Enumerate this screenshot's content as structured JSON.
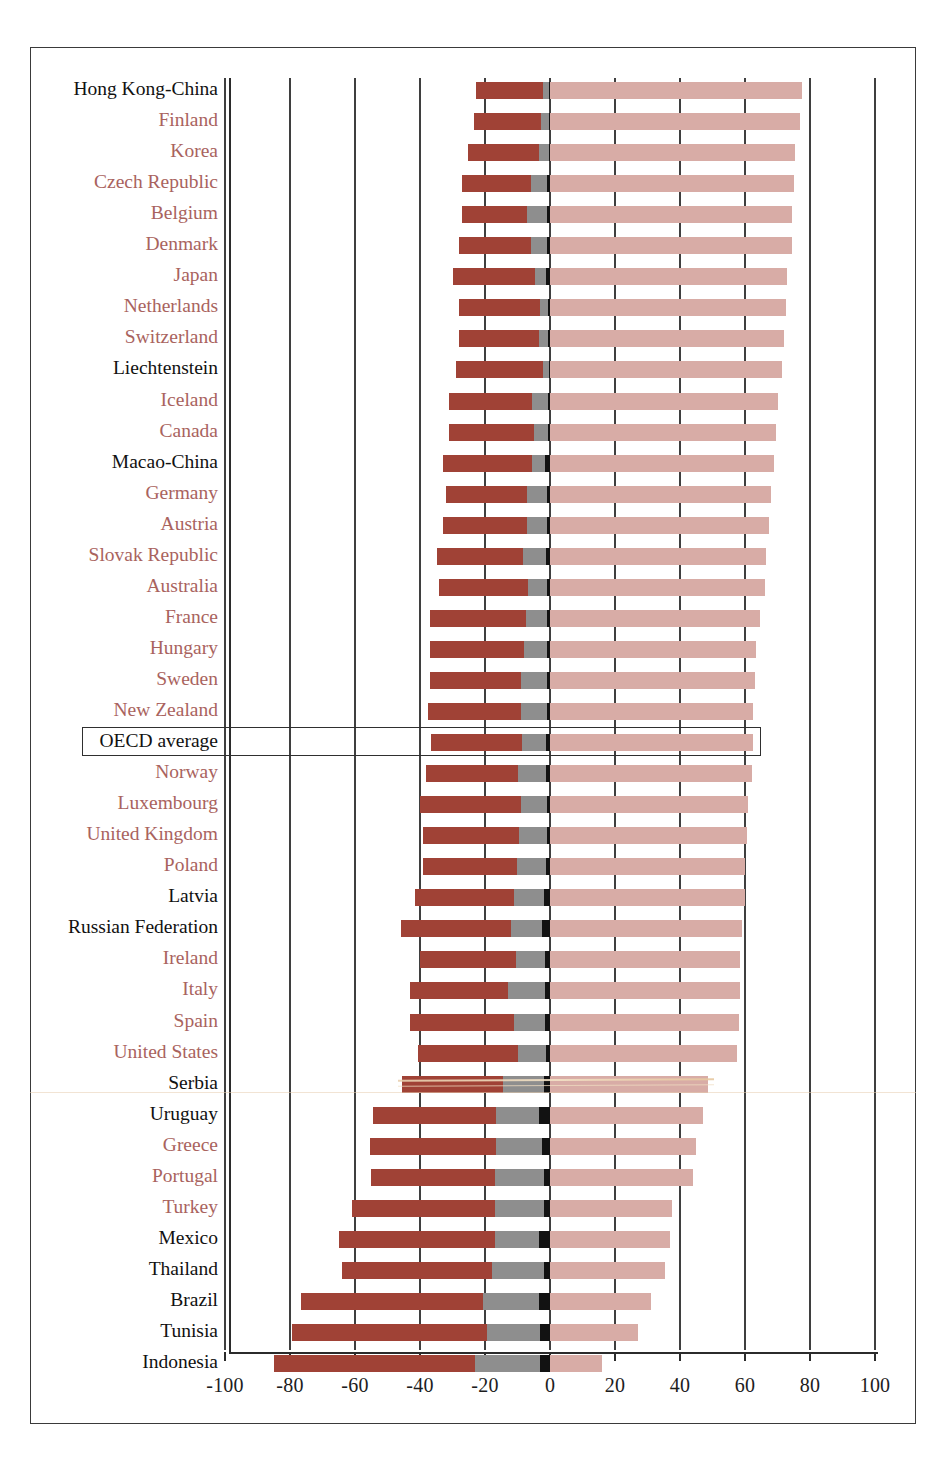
{
  "chart_data": {
    "type": "bar",
    "title": "",
    "subtitle": "",
    "xlabel": "",
    "ylabel": "",
    "orientation": "horizontal",
    "stacked": true,
    "diverging": true,
    "xlim": [
      -100,
      100
    ],
    "xticks": [
      -100,
      -80,
      -60,
      -40,
      -20,
      0,
      20,
      40,
      60,
      80,
      100
    ],
    "xticklabels": [
      "-100",
      "-80",
      "-60",
      "-40",
      "-20",
      "0",
      "20",
      "40",
      "60",
      "80",
      "100"
    ],
    "grid": true,
    "grid_axis": "x",
    "legend_position": "none",
    "series": [
      {
        "name": "below-level-1-negative",
        "color": "#a04236"
      },
      {
        "name": "level-1-negative",
        "color": "#8e8e8e"
      },
      {
        "name": "level-1-black-band",
        "color": "#121212"
      },
      {
        "name": "level-2-and-above-positive",
        "color": "#d8aca6"
      }
    ],
    "categories": [
      "Hong Kong-China",
      "Finland",
      "Korea",
      "Czech Republic",
      "Belgium",
      "Denmark",
      "Japan",
      "Netherlands",
      "Switzerland",
      "Liechtenstein",
      "Iceland",
      "Canada",
      "Macao-China",
      "Germany",
      "Austria",
      "Slovak Republic",
      "Australia",
      "France",
      "Hungary",
      "Sweden",
      "New Zealand",
      "OECD average",
      "Norway",
      "Luxembourg",
      "United Kingdom",
      "Poland",
      "Latvia",
      "Russian Federation",
      "Ireland",
      "Italy",
      "Spain",
      "United States",
      "Serbia",
      "Uruguay",
      "Greece",
      "Portugal",
      "Turkey",
      "Mexico",
      "Thailand",
      "Brazil",
      "Tunisia",
      "Indonesia"
    ],
    "rows": [
      {
        "category": "Hong Kong-China",
        "group": "partner",
        "neg_dark": -20.5,
        "neg_grey": -2.0,
        "neg_black": -0.3,
        "pos_light": 77.5
      },
      {
        "category": "Finland",
        "group": "member",
        "neg_dark": -20.5,
        "neg_grey": -2.5,
        "neg_black": -0.3,
        "pos_light": 77.0
      },
      {
        "category": "Korea",
        "group": "member",
        "neg_dark": -22.0,
        "neg_grey": -3.0,
        "neg_black": -0.3,
        "pos_light": 75.5
      },
      {
        "category": "Czech Republic",
        "group": "member",
        "neg_dark": -21.0,
        "neg_grey": -5.0,
        "neg_black": -1.0,
        "pos_light": 75.0
      },
      {
        "category": "Belgium",
        "group": "member",
        "neg_dark": -20.0,
        "neg_grey": -6.0,
        "neg_black": -1.0,
        "pos_light": 74.5
      },
      {
        "category": "Denmark",
        "group": "member",
        "neg_dark": -22.0,
        "neg_grey": -5.0,
        "neg_black": -1.0,
        "pos_light": 74.5
      },
      {
        "category": "Japan",
        "group": "member",
        "neg_dark": -25.0,
        "neg_grey": -3.5,
        "neg_black": -1.2,
        "pos_light": 73.0
      },
      {
        "category": "Netherlands",
        "group": "member",
        "neg_dark": -25.0,
        "neg_grey": -2.5,
        "neg_black": -0.5,
        "pos_light": 72.5
      },
      {
        "category": "Switzerland",
        "group": "member",
        "neg_dark": -24.5,
        "neg_grey": -3.0,
        "neg_black": -0.5,
        "pos_light": 72.0
      },
      {
        "category": "Liechtenstein",
        "group": "partner",
        "neg_dark": -26.5,
        "neg_grey": -2.0,
        "neg_black": -0.3,
        "pos_light": 71.5
      },
      {
        "category": "Iceland",
        "group": "member",
        "neg_dark": -25.5,
        "neg_grey": -5.0,
        "neg_black": -0.5,
        "pos_light": 70.0
      },
      {
        "category": "Canada",
        "group": "member",
        "neg_dark": -26.0,
        "neg_grey": -4.5,
        "neg_black": -0.5,
        "pos_light": 69.5
      },
      {
        "category": "Macao-China",
        "group": "partner",
        "neg_dark": -27.5,
        "neg_grey": -4.0,
        "neg_black": -1.5,
        "pos_light": 69.0
      },
      {
        "category": "Germany",
        "group": "member",
        "neg_dark": -25.0,
        "neg_grey": -6.0,
        "neg_black": -1.0,
        "pos_light": 68.0
      },
      {
        "category": "Austria",
        "group": "member",
        "neg_dark": -26.0,
        "neg_grey": -6.0,
        "neg_black": -1.0,
        "pos_light": 67.5
      },
      {
        "category": "Slovak Republic",
        "group": "member",
        "neg_dark": -26.5,
        "neg_grey": -7.0,
        "neg_black": -1.2,
        "pos_light": 66.5
      },
      {
        "category": "Australia",
        "group": "member",
        "neg_dark": -27.5,
        "neg_grey": -6.0,
        "neg_black": -0.8,
        "pos_light": 66.0
      },
      {
        "category": "France",
        "group": "member",
        "neg_dark": -29.5,
        "neg_grey": -6.5,
        "neg_black": -1.0,
        "pos_light": 64.5
      },
      {
        "category": "Hungary",
        "group": "member",
        "neg_dark": -29.0,
        "neg_grey": -7.0,
        "neg_black": -1.0,
        "pos_light": 63.5
      },
      {
        "category": "Sweden",
        "group": "member",
        "neg_dark": -28.0,
        "neg_grey": -8.0,
        "neg_black": -1.0,
        "pos_light": 63.0
      },
      {
        "category": "New Zealand",
        "group": "member",
        "neg_dark": -28.5,
        "neg_grey": -8.0,
        "neg_black": -1.0,
        "pos_light": 62.5
      },
      {
        "category": "OECD average",
        "group": "oecd",
        "neg_dark": -28.0,
        "neg_grey": -7.5,
        "neg_black": -1.2,
        "pos_light": 62.5
      },
      {
        "category": "Norway",
        "group": "member",
        "neg_dark": -28.5,
        "neg_grey": -8.5,
        "neg_black": -1.2,
        "pos_light": 62.0
      },
      {
        "category": "Luxembourg",
        "group": "member",
        "neg_dark": -31.0,
        "neg_grey": -8.0,
        "neg_black": -1.0,
        "pos_light": 61.0
      },
      {
        "category": "United Kingdom",
        "group": "member",
        "neg_dark": -29.5,
        "neg_grey": -8.5,
        "neg_black": -1.0,
        "pos_light": 60.5
      },
      {
        "category": "Poland",
        "group": "member",
        "neg_dark": -29.0,
        "neg_grey": -9.0,
        "neg_black": -1.2,
        "pos_light": 60.0
      },
      {
        "category": "Latvia",
        "group": "partner",
        "neg_dark": -30.5,
        "neg_grey": -9.0,
        "neg_black": -2.0,
        "pos_light": 60.0
      },
      {
        "category": "Russian Federation",
        "group": "partner",
        "neg_dark": -34.0,
        "neg_grey": -9.5,
        "neg_black": -2.5,
        "pos_light": 59.0
      },
      {
        "category": "Ireland",
        "group": "member",
        "neg_dark": -29.5,
        "neg_grey": -9.0,
        "neg_black": -1.5,
        "pos_light": 58.5
      },
      {
        "category": "Italy",
        "group": "member",
        "neg_dark": -30.0,
        "neg_grey": -11.5,
        "neg_black": -1.5,
        "pos_light": 58.5
      },
      {
        "category": "Spain",
        "group": "member",
        "neg_dark": -32.0,
        "neg_grey": -9.5,
        "neg_black": -1.5,
        "pos_light": 58.0
      },
      {
        "category": "United States",
        "group": "member",
        "neg_dark": -31.0,
        "neg_grey": -8.5,
        "neg_black": -1.2,
        "pos_light": 57.5
      },
      {
        "category": "Serbia",
        "group": "partner",
        "neg_dark": -31.0,
        "neg_grey": -12.5,
        "neg_black": -2.0,
        "pos_light": 48.5
      },
      {
        "category": "Uruguay",
        "group": "partner",
        "neg_dark": -38.0,
        "neg_grey": -13.0,
        "neg_black": -3.5,
        "pos_light": 47.0
      },
      {
        "category": "Greece",
        "group": "member",
        "neg_dark": -39.0,
        "neg_grey": -14.0,
        "neg_black": -2.5,
        "pos_light": 45.0
      },
      {
        "category": "Portugal",
        "group": "member",
        "neg_dark": -38.0,
        "neg_grey": -15.0,
        "neg_black": -2.0,
        "pos_light": 44.0
      },
      {
        "category": "Turkey",
        "group": "member",
        "neg_dark": -44.0,
        "neg_grey": -15.0,
        "neg_black": -2.0,
        "pos_light": 37.5
      },
      {
        "category": "Mexico",
        "group": "partner",
        "neg_dark": -48.0,
        "neg_grey": -13.5,
        "neg_black": -3.5,
        "pos_light": 37.0
      },
      {
        "category": "Thailand",
        "group": "partner",
        "neg_dark": -46.0,
        "neg_grey": -16.0,
        "neg_black": -2.0,
        "pos_light": 35.5
      },
      {
        "category": "Brazil",
        "group": "partner",
        "neg_dark": -56.0,
        "neg_grey": -17.0,
        "neg_black": -3.5,
        "pos_light": 31.0
      },
      {
        "category": "Tunisia",
        "group": "partner",
        "neg_dark": -60.0,
        "neg_grey": -16.5,
        "neg_black": -3.0,
        "pos_light": 27.0
      },
      {
        "category": "Indonesia",
        "group": "partner",
        "neg_dark": -62.0,
        "neg_grey": -20.0,
        "neg_black": -3.0,
        "pos_light": 16.0
      }
    ],
    "colors": {
      "below_level_1": "#a04236",
      "level_1": "#8e8e8e",
      "black_band": "#121212",
      "level_2_plus": "#d8aca6",
      "oecd_member_label": "#a9635e",
      "partner_label": "#111111",
      "gridline": "#3f3f3f",
      "frame": "#3a3a3a"
    },
    "highlight": {
      "category": "OECD average",
      "style": "boxed-row"
    }
  }
}
